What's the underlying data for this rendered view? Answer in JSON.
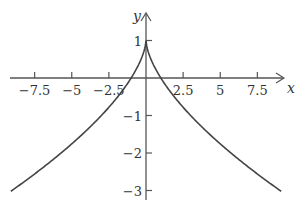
{
  "chart_data": {
    "type": "line",
    "title": "",
    "xlabel": "x",
    "ylabel": "y",
    "xlim": [
      -9.2,
      9.2
    ],
    "ylim": [
      -3.3,
      1.2
    ],
    "grid": false,
    "x_ticks": [
      -7.5,
      -5,
      -2.5,
      2.5,
      5,
      7.5
    ],
    "x_tick_labels": [
      "−7.5",
      "−5",
      "−2.5",
      "2.5",
      "5",
      "7.5"
    ],
    "y_ticks": [
      1,
      -1,
      -2,
      -3
    ],
    "y_tick_labels": [
      "1",
      "−1",
      "−2",
      "−3"
    ],
    "series": [
      {
        "name": "y = 1 − |x|^0.63",
        "color": "#444444",
        "x": [
          -9.1,
          -8,
          -7,
          -6,
          -5,
          -4,
          -3,
          -2,
          -1,
          -0.5,
          0,
          0.5,
          1,
          2,
          3,
          4,
          5,
          6,
          7,
          8,
          9.1
        ],
        "y": [
          -3.02,
          -2.71,
          -2.41,
          -2.09,
          -1.76,
          -1.4,
          -1.0,
          -0.55,
          0.0,
          0.35,
          1.0,
          0.35,
          0.0,
          -0.55,
          -1.0,
          -1.4,
          -1.76,
          -2.09,
          -2.41,
          -2.71,
          -3.02
        ]
      }
    ]
  }
}
